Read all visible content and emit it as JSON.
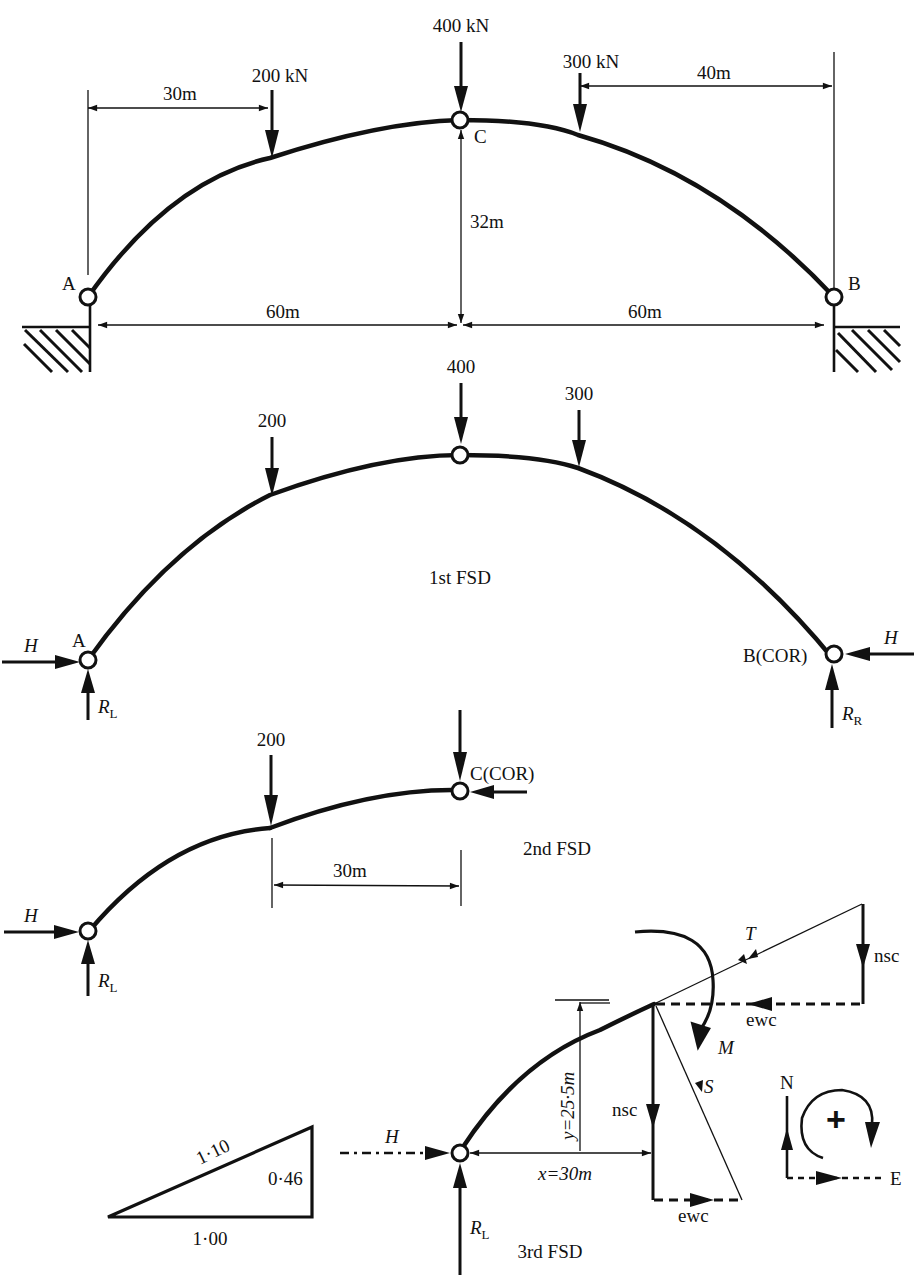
{
  "figure": {
    "colors": {
      "ink": "#111111",
      "background": "#ffffff"
    },
    "arch_diagram": {
      "loads": [
        {
          "label": "200 kN",
          "x_from_A": "30m"
        },
        {
          "label": "400 kN",
          "at": "C"
        },
        {
          "label": "300 kN",
          "x_from_B": "40m"
        }
      ],
      "dimensions": {
        "left_load_offset": "30m",
        "right_load_offset": "40m",
        "rise": "32m",
        "left_half_span": "60m",
        "right_half_span": "60m"
      },
      "supports": {
        "left": "A",
        "right": "B",
        "crown_hinge": "C"
      }
    },
    "fsd1": {
      "title": "1st FSD",
      "loads": [
        "200",
        "400",
        "300"
      ],
      "left_support": "A",
      "right_support": "B(COR)",
      "horizontal_force": "H",
      "left_reaction": {
        "main": "R",
        "sub": "L"
      },
      "right_reaction": {
        "main": "R",
        "sub": "R"
      }
    },
    "fsd2": {
      "title": "2nd FSD",
      "load": "200",
      "crown": "C(COR)",
      "dimension": "30m",
      "horizontal_force": "H",
      "reaction": {
        "main": "R",
        "sub": "L"
      }
    },
    "fsd3": {
      "title": "3rd FSD",
      "horizontal_force": "H",
      "reaction": {
        "main": "R",
        "sub": "L"
      },
      "x_dim": "x=30m",
      "y_dim": "y=25·5m",
      "thrust": "T",
      "shear": "S",
      "moment": "M",
      "nsc_top": "nsc",
      "nsc_mid": "nsc",
      "ewc_top": "ewc",
      "ewc_bottom": "ewc"
    },
    "slope_triangle": {
      "hypotenuse": "1·10",
      "vertical": "0·46",
      "base": "1·00"
    },
    "sign_convention": {
      "north": "N",
      "east": "E",
      "moment_sign": "+"
    }
  }
}
